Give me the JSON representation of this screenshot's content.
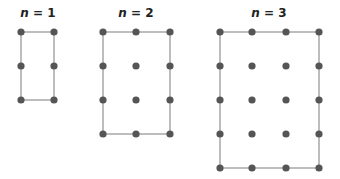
{
  "diagram": {
    "colors": {
      "dot": "#555555",
      "edge": "#9a9a9a",
      "text": "#222222"
    },
    "panels": [
      {
        "label_var": "n",
        "label_eq": " = 1",
        "title_x": 38,
        "cols_x": [
          21,
          54
        ],
        "rows_y": [
          32,
          66,
          100
        ]
      },
      {
        "label_var": "n",
        "label_eq": " = 2",
        "title_x": 136,
        "cols_x": [
          103,
          136,
          170
        ],
        "rows_y": [
          32,
          66,
          100,
          134
        ]
      },
      {
        "label_var": "n",
        "label_eq": " = 3",
        "title_x": 269,
        "cols_x": [
          220,
          252,
          286,
          319
        ],
        "rows_y": [
          32,
          66,
          100,
          134,
          168
        ]
      }
    ]
  }
}
